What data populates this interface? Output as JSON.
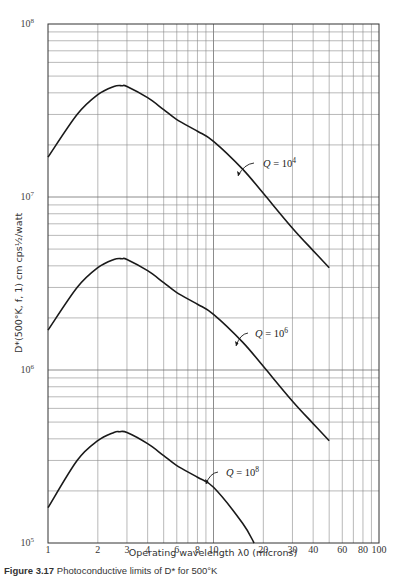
{
  "chart_data": {
    "type": "line",
    "title": "",
    "xlabel": "Operating wavelength λ0 (microns)",
    "ylabel": "D*(500°K, f, 1) cm cps½/watt",
    "xscale": "log",
    "yscale": "log",
    "xlim": [
      1,
      100
    ],
    "ylim": [
      100000,
      100000000
    ],
    "grid": true,
    "legend": "none (inline curve labels with leader arrows)",
    "x_ticks": [
      "1",
      "2",
      "3",
      "4",
      "6",
      "8",
      "10",
      "20",
      "30",
      "40",
      "60",
      "80",
      "100"
    ],
    "y_ticks": [
      {
        "base": "10",
        "exp": "5"
      },
      {
        "base": "10",
        "exp": "6"
      },
      {
        "base": "10",
        "exp": "7"
      },
      {
        "base": "10",
        "exp": "8"
      }
    ],
    "series": [
      {
        "name": "Q = 10^4",
        "label": "Q = 10",
        "label_exp": "4",
        "x": [
          1,
          1.5,
          2,
          2.5,
          2.8,
          3,
          4,
          5,
          6,
          8,
          10,
          15,
          20,
          30,
          40,
          50
        ],
        "y": [
          17000000.0,
          30000000.0,
          39000000.0,
          43500000.0,
          44000000.0,
          43500000.0,
          37500000.0,
          32000000.0,
          28000000.0,
          24000000.0,
          21000000.0,
          14500000.0,
          10500000.0,
          6600000.0,
          4900000.0,
          3900000.0
        ]
      },
      {
        "name": "Q = 10^6",
        "label": "Q = 10",
        "label_exp": "6",
        "x": [
          1,
          1.5,
          2,
          2.5,
          2.8,
          3,
          4,
          5,
          6,
          8,
          10,
          15,
          20,
          30,
          40,
          50
        ],
        "y": [
          1700000.0,
          3000000.0,
          3900000.0,
          4350000.0,
          4400000.0,
          4350000.0,
          3750000.0,
          3200000.0,
          2800000.0,
          2400000.0,
          2100000.0,
          1450000.0,
          1050000.0,
          660000.0,
          490000.0,
          390000.0
        ]
      },
      {
        "name": "Q = 10^8",
        "label": "Q = 10",
        "label_exp": "8",
        "x": [
          1,
          1.5,
          2,
          2.5,
          2.7,
          3,
          4,
          5,
          6,
          8,
          10,
          15,
          17.6
        ],
        "y": [
          160000.0,
          300000.0,
          390000.0,
          435000.0,
          440000.0,
          435000.0,
          375000.0,
          320000.0,
          280000.0,
          240000.0,
          210000.0,
          130000.0,
          100000.0
        ]
      }
    ]
  },
  "caption": {
    "figure_label": "Figure 3.17",
    "text": "Photoconductive limits of D* for 500°K"
  }
}
